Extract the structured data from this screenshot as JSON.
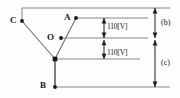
{
  "diagram": {
    "type": "three-wire-voltage-diagram",
    "nodes": [
      {
        "id": "C",
        "label": "C",
        "x": 22,
        "y": 21
      },
      {
        "id": "A",
        "label": "A",
        "x": 76,
        "y": 18
      },
      {
        "id": "O",
        "label": "O",
        "x": 61,
        "y": 38
      },
      {
        "id": "N",
        "label": "",
        "x": 55,
        "y": 59
      },
      {
        "id": "B",
        "label": "B",
        "x": 53,
        "y": 87
      }
    ],
    "node_labels": {
      "C": "C",
      "A": "A",
      "O": "O",
      "B": "B"
    },
    "dimension_labels": {
      "upper": "110[V]",
      "lower": "110[V]"
    },
    "bracket_labels": {
      "upper": "(b)",
      "lower": "(c)"
    },
    "colors": {
      "line": "#6e6e6e",
      "dark_line": "#2b2b2b",
      "text": "#141414",
      "background": "#fdfdfd"
    }
  }
}
